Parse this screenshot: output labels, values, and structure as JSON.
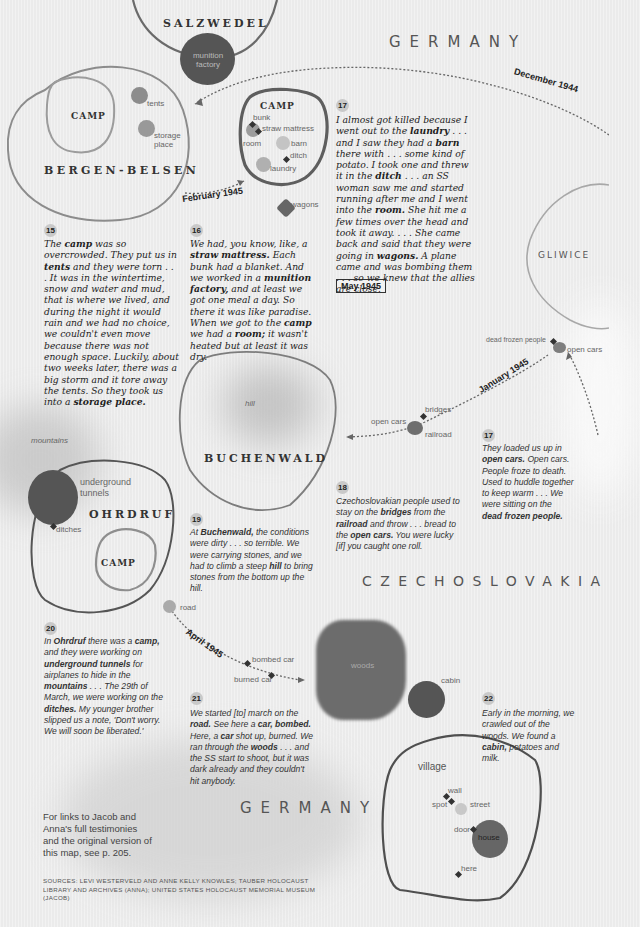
{
  "places": {
    "salzwedel": "SALZWEDEL",
    "bergen_belsen": "BERGEN-BELSEN",
    "buchenwald": "BUCHENWALD",
    "ohrdruf": "OHRDRUF",
    "gliwice": "GLIWICE",
    "camp": "CAMP"
  },
  "countries": {
    "germany_top": "GERMANY",
    "czechoslovakia": "CZECHOSLOVAKIA",
    "germany_bottom": "GERMANY"
  },
  "labels": {
    "munition_factory": "munition factory",
    "tents": "tents",
    "storage_place": "storage place",
    "bunk": "bunk",
    "straw_mattress": "straw mattress",
    "room": "room",
    "barn": "barn",
    "ditch": "ditch",
    "laundry": "laundry",
    "wagons": "wagons",
    "dead_frozen_people": "dead frozen people",
    "open_cars_gliwice": "open cars",
    "bridges": "bridges",
    "open_cars": "open cars",
    "railroad": "railroad",
    "hill": "hill",
    "mountains": "mountains",
    "underground_tunnels": "underground tunnels",
    "ditches": "ditches",
    "road": "road",
    "bombed_car": "bombed car",
    "burned_car": "burned car",
    "woods": "woods",
    "cabin": "cabin",
    "village": "village",
    "wall": "wall",
    "spot": "spot",
    "street": "street",
    "door": "door",
    "house": "house",
    "here": "here"
  },
  "dates": {
    "december_1944": "December 1944",
    "february_1945": "February 1945",
    "january_1945": "January 1945",
    "april_1945": "April 1945",
    "may_1945": "May 1945"
  },
  "stories": [
    {
      "number": "15",
      "speaker": "Anna",
      "parts": [
        {
          "t": "The "
        },
        {
          "b": "camp"
        },
        {
          "t": " was so overcrowded. They put us in "
        },
        {
          "b": "tents"
        },
        {
          "t": " and they were torn . . . It was in the wintertime, snow and water and mud, that is where we lived, and during the night it would rain and we had no choice, we couldn't even move because there was not enough space. Luckily, about two weeks later, there was a big storm and it tore away the tents. So they took us into a "
        },
        {
          "b": "storage place."
        }
      ]
    },
    {
      "number": "16",
      "speaker": "Anna",
      "parts": [
        {
          "t": "We had, you know, like, a "
        },
        {
          "b": "straw mattress."
        },
        {
          "t": " Each bunk had a blanket. And we worked in a "
        },
        {
          "b": "munition factory,"
        },
        {
          "t": " and at least we got one meal a day. So there it was like paradise. When we got to the "
        },
        {
          "b": "camp"
        },
        {
          "t": " we had a "
        },
        {
          "b": "room;"
        },
        {
          "t": " it wasn't heated but at least it was dry."
        }
      ]
    },
    {
      "number": "17",
      "speaker": "Anna",
      "parts": [
        {
          "t": "I almost got killed because I went out to the "
        },
        {
          "b": "laundry"
        },
        {
          "t": " . . . and I saw they had a "
        },
        {
          "b": "barn"
        },
        {
          "t": " there with . . . some kind of potato. I took one and threw it in the "
        },
        {
          "b": "ditch"
        },
        {
          "t": " . . . an SS woman saw me and started running after me and I went into the "
        },
        {
          "b": "room."
        },
        {
          "t": " She hit me a few times over the head and took it away. . . . She came back and said that they were going in "
        },
        {
          "b": "wagons."
        },
        {
          "t": " A plane came and was bombing them . . . so we knew that the allies are close."
        }
      ]
    },
    {
      "number": "17",
      "speaker": "Jacob",
      "parts": [
        {
          "t": "They loaded us up in "
        },
        {
          "b": "open cars."
        },
        {
          "t": " Open cars. People froze to death. Used to huddle together to keep warm . . . We were sitting on the "
        },
        {
          "b": "dead frozen people."
        }
      ]
    },
    {
      "number": "18",
      "speaker": "Jacob",
      "parts": [
        {
          "t": "Czechoslovakian people used to stay on the "
        },
        {
          "b": "bridges"
        },
        {
          "t": " from the "
        },
        {
          "b": "railroad"
        },
        {
          "t": " and throw . . . bread to the "
        },
        {
          "b": "open cars."
        },
        {
          "t": " You were lucky [if] you caught one roll."
        }
      ]
    },
    {
      "number": "19",
      "speaker": "Jacob",
      "parts": [
        {
          "t": "At "
        },
        {
          "b": "Buchenwald,"
        },
        {
          "t": " the conditions were dirty . . . so terrible. We were carrying stones, and we had to climb a steep "
        },
        {
          "b": "hill"
        },
        {
          "t": " to bring stones from the bottom up the hill."
        }
      ]
    },
    {
      "number": "20",
      "speaker": "Jacob",
      "parts": [
        {
          "t": "In "
        },
        {
          "b": "Ohrdruf"
        },
        {
          "t": " there was a "
        },
        {
          "b": "camp,"
        },
        {
          "t": " and they were working on "
        },
        {
          "b": "underground tunnels"
        },
        {
          "t": " for airplanes to hide in the "
        },
        {
          "b": "mountains"
        },
        {
          "t": " . . . The 29th of March, we were working on the "
        },
        {
          "b": "ditches."
        },
        {
          "t": " My younger brother slipped us a note, 'Don't worry. We will soon be liberated.'"
        }
      ]
    },
    {
      "number": "21",
      "speaker": "Jacob",
      "parts": [
        {
          "t": "We started [to] march on the "
        },
        {
          "b": "road."
        },
        {
          "t": " See here a "
        },
        {
          "b": "car, bombed."
        },
        {
          "t": " Here, a "
        },
        {
          "b": "car"
        },
        {
          "t": " shot up, burned. We ran through the "
        },
        {
          "b": "woods"
        },
        {
          "t": " . . . and the SS start to shoot, but it was dark already and they couldn't hit anybody."
        }
      ]
    },
    {
      "number": "22",
      "speaker": "Jacob",
      "parts": [
        {
          "t": "Early in the morning, we crawled out of the woods. We found a "
        },
        {
          "b": "cabin,"
        },
        {
          "t": " potatoes and milk."
        }
      ]
    }
  ],
  "footer": {
    "note": "For links to Jacob and Anna's full testimonies and the original version of this map, see p. 205.",
    "sources": "SOURCES: LEVI WESTERVELD AND ANNE KELLY KNOWLES; TAUBER HOLOCAUST LIBRARY AND ARCHIVES (ANNA); UNITED STATES HOLOCAUST MEMORIAL MUSEUM (JACOB)"
  },
  "colors": {
    "background": "#ebebeb",
    "ink": "#222222",
    "outline": "#5e5e5e",
    "blob_dark": "#555555",
    "blob_mid": "#8a8a8a",
    "blob_light": "#b8b8b8",
    "route": "#666666"
  }
}
